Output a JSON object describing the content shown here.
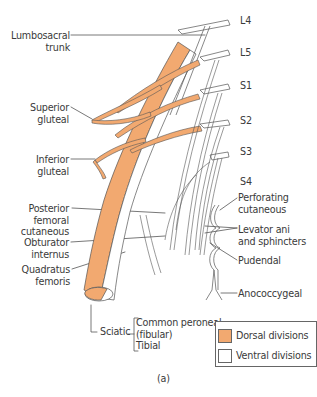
{
  "figure": {
    "caption": "(a)",
    "colors": {
      "dorsal": "#f2a970",
      "ventral": "#ffffff",
      "outline": "#555555"
    }
  },
  "roots": [
    "L4",
    "L5",
    "S1",
    "S2",
    "S3",
    "S4"
  ],
  "left_labels": {
    "lumbosacral_trunk": [
      "Lumbosacral",
      "trunk"
    ],
    "superior_gluteal": [
      "Superior",
      "gluteal"
    ],
    "inferior_gluteal": [
      "Inferior",
      "gluteal"
    ],
    "posterior_femoral_cutaneous": [
      "Posterior",
      "femoral",
      "cutaneous"
    ],
    "obturator_internus": [
      "Obturator",
      "internus"
    ],
    "quadratus_femoris": [
      "Quadratus",
      "femoris"
    ]
  },
  "right_labels": {
    "perforating_cutaneous": [
      "Perforating",
      "cutaneous"
    ],
    "levator_ani": [
      "Levator ani",
      "and sphincters"
    ],
    "pudendal": "Pudendal",
    "anococcygeal": "Anococcygeal"
  },
  "sciatic": {
    "label": "Sciatic",
    "branches": [
      "Common peroneal",
      "(fibular)",
      "Tibial"
    ]
  },
  "legend": {
    "items": [
      {
        "label": "Dorsal divisions",
        "color": "#f2a970"
      },
      {
        "label": "Ventral divisions",
        "color": "#ffffff"
      }
    ]
  }
}
